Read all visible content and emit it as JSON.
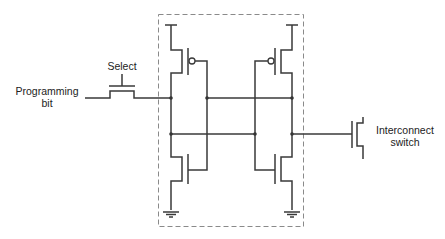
{
  "diagram": {
    "type": "circuit-schematic",
    "labels": {
      "programming_bit_line1": "Programming",
      "programming_bit_line2": "bit",
      "select": "Select",
      "interconnect_switch_line1": "Interconnect",
      "interconnect_switch_line2": "switch"
    },
    "components": [
      {
        "id": "select-transistor",
        "kind": "nmos-pass-transistor",
        "label": "Select"
      },
      {
        "id": "pmos-left",
        "kind": "pmos"
      },
      {
        "id": "pmos-right",
        "kind": "pmos"
      },
      {
        "id": "nmos-left",
        "kind": "nmos"
      },
      {
        "id": "nmos-right",
        "kind": "nmos"
      },
      {
        "id": "interconnect-switch",
        "kind": "nmos-pass-transistor",
        "label": "Interconnect switch"
      }
    ],
    "enclosure": "dashed box around cross-coupled inverter pair",
    "colors": {
      "line": "#3a3a3a",
      "dashed_box": "#8a8a8a",
      "background": "#ffffff"
    }
  }
}
